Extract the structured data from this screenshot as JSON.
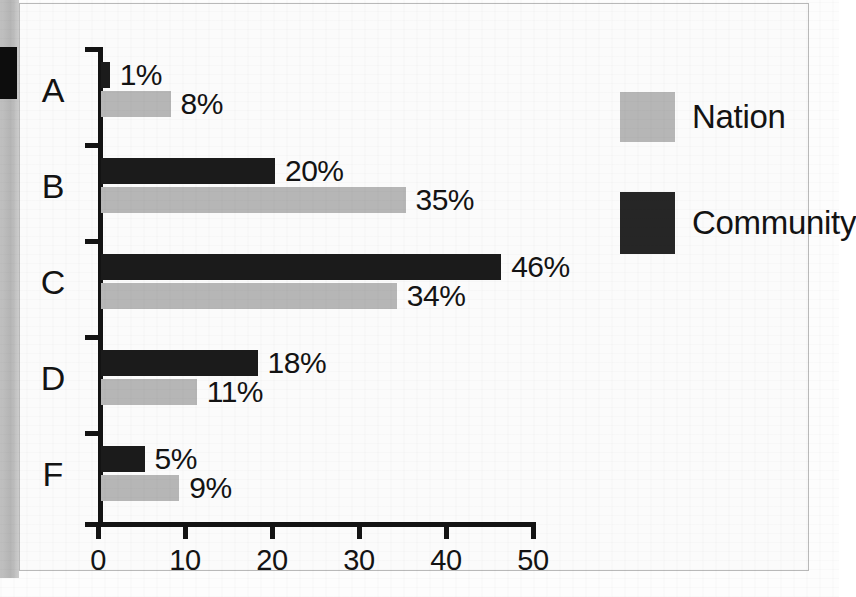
{
  "chart_data": {
    "type": "bar",
    "orientation": "horizontal",
    "title": "",
    "xlabel": "",
    "ylabel": "",
    "categories": [
      "A",
      "B",
      "C",
      "D",
      "F"
    ],
    "xlim": [
      0,
      50
    ],
    "xticks": [
      0,
      10,
      20,
      30,
      40,
      50
    ],
    "xtick_labels": [
      "0",
      "10",
      "20",
      "30",
      "40",
      "50"
    ],
    "grid": false,
    "legend_position": "right",
    "series": [
      {
        "name": "Community",
        "color": "#1b1b1b",
        "values": [
          1,
          20,
          46,
          18,
          5
        ],
        "value_labels": [
          "1%",
          "20%",
          "46%",
          "18%",
          "5%"
        ]
      },
      {
        "name": "Nation",
        "color": "#b6b6b6",
        "values": [
          8,
          35,
          34,
          11,
          9
        ],
        "value_labels": [
          "8%",
          "35%",
          "34%",
          "11%",
          "9%"
        ]
      }
    ]
  },
  "legend": {
    "items": [
      {
        "label": "Nation",
        "color": "#b6b6b6"
      },
      {
        "label": "Community",
        "color": "#1b1b1b"
      }
    ]
  },
  "colors": {
    "community": "#1b1b1b",
    "nation": "#b6b6b6",
    "axis": "#131313",
    "page": "#fdfdfd",
    "frame_border": "#b9b9b9"
  }
}
